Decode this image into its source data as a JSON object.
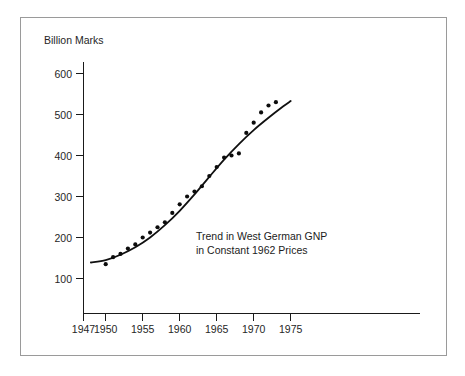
{
  "chart_data": {
    "type": "scatter",
    "title": "",
    "annotation_lines": [
      "Trend in West German GNP",
      "in Constant 1962 Prices"
    ],
    "xlabel": "",
    "ylabel": "Billion Marks",
    "xlim": [
      1947,
      1976
    ],
    "ylim": [
      100,
      640
    ],
    "grid": false,
    "legend": null,
    "x_ticks": [
      1947,
      1950,
      1955,
      1960,
      1965,
      1970,
      1975
    ],
    "x_tick_labels": [
      "1947",
      "1950",
      "1955",
      "1960",
      "1965",
      "1970",
      "1975"
    ],
    "y_ticks": [
      100,
      200,
      300,
      400,
      500,
      600
    ],
    "y_tick_labels": [
      "100",
      "200",
      "300",
      "400",
      "500",
      "600"
    ],
    "series": [
      {
        "name": "West German GNP (observations)",
        "kind": "scatter",
        "marker": "filled-circle",
        "color": "#0c0c0c",
        "x": [
          1950,
          1951,
          1952,
          1953,
          1954,
          1955,
          1956,
          1957,
          1958,
          1959,
          1960,
          1961,
          1962,
          1963,
          1964,
          1965,
          1966,
          1967,
          1968,
          1969,
          1970,
          1971,
          1972,
          1973
        ],
        "y": [
          135,
          152,
          160,
          173,
          183,
          200,
          212,
          225,
          237,
          260,
          281,
          300,
          312,
          325,
          350,
          372,
          395,
          400,
          405,
          455,
          480,
          505,
          522,
          530
        ]
      },
      {
        "name": "Fitted trend",
        "kind": "line",
        "color": "#101010",
        "x": [
          1948,
          1950,
          1952,
          1954,
          1956,
          1958,
          1960,
          1962,
          1964,
          1966,
          1968,
          1970,
          1972,
          1974,
          1975
        ],
        "y": [
          139,
          145,
          158,
          176,
          200,
          230,
          265,
          305,
          348,
          390,
          428,
          462,
          492,
          520,
          533
        ]
      }
    ]
  },
  "axes": {
    "y_axis_title": "Billion Marks"
  }
}
